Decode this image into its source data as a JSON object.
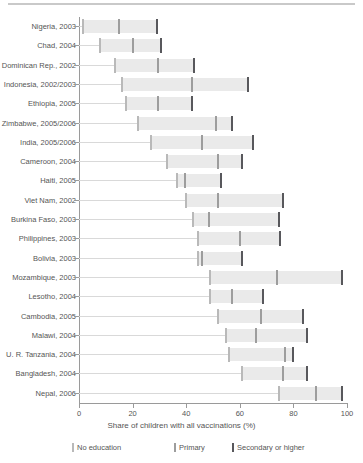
{
  "chart_data": {
    "type": "bar",
    "title": "",
    "xlabel": "Share of children with all vaccinations (%)",
    "ylabel": "",
    "xlim": [
      0,
      100
    ],
    "xticks": [
      0,
      20,
      40,
      60,
      80,
      100
    ],
    "xtick_labels": [
      "0",
      "20",
      "40",
      "60",
      "80",
      "100"
    ],
    "grid": false,
    "legend_position": "bottom",
    "series": [
      {
        "name": "No education",
        "key": "no_education",
        "color": "#b9b9b9"
      },
      {
        "name": "Primary",
        "key": "primary",
        "color": "#9d9d9d"
      },
      {
        "name": "Secondary or higher",
        "key": "secondary",
        "color": "#58585c"
      }
    ],
    "categories": [
      "Nigeria, 2003",
      "Chad, 2004",
      "Dominican Rep., 2002",
      "Indonesia, 2002/2003",
      "Ethiopia, 2005",
      "Zimbabwe, 2005/2006",
      "India, 2005/2006",
      "Cameroon, 2004",
      "Haiti, 2005",
      "Viet Nam, 2002",
      "Burkina Faso, 2003",
      "Philippines, 2003",
      "Bolivia, 2003",
      "Mozambique, 2003",
      "Lesotho, 2004",
      "Cambodia, 2005",
      "Malawi, 2004",
      "U. R. Tanzania, 2004",
      "Bangladesh, 2004",
      "Nepal, 2006"
    ],
    "rows": [
      {
        "label": "Nigeria, 2003",
        "no_education": 1.5,
        "primary": 15.0,
        "secondary": 29.0
      },
      {
        "label": "Chad, 2004",
        "no_education": 8.0,
        "primary": 20.0,
        "secondary": 30.5
      },
      {
        "label": "Dominican Rep., 2002",
        "no_education": 13.5,
        "primary": 29.5,
        "secondary": 43.0
      },
      {
        "label": "Indonesia, 2002/2003",
        "no_education": 16.0,
        "primary": 42.0,
        "secondary": 63.0
      },
      {
        "label": "Ethiopia, 2005",
        "no_education": 17.5,
        "primary": 29.5,
        "secondary": 42.0
      },
      {
        "label": "Zimbabwe, 2005/2006",
        "no_education": 22.0,
        "primary": 51.0,
        "secondary": 57.0
      },
      {
        "label": "India, 2005/2006",
        "no_education": 27.0,
        "primary": 46.0,
        "secondary": 65.0
      },
      {
        "label": "Cameroon, 2004",
        "no_education": 33.0,
        "primary": 52.0,
        "secondary": 61.0
      },
      {
        "label": "Haiti, 2005",
        "no_education": 36.5,
        "primary": 39.5,
        "secondary": 53.0
      },
      {
        "label": "Viet Nam, 2002",
        "no_education": 40.0,
        "primary": 52.0,
        "secondary": 76.0
      },
      {
        "label": "Burkina Faso, 2003",
        "no_education": 42.5,
        "primary": 48.5,
        "secondary": 74.5
      },
      {
        "label": "Philippines, 2003",
        "no_education": 44.5,
        "primary": 60.0,
        "secondary": 75.0
      },
      {
        "label": "Bolivia, 2003",
        "no_education": 44.5,
        "primary": 46.0,
        "secondary": 61.0
      },
      {
        "label": "Mozambique, 2003",
        "no_education": 49.0,
        "primary": 74.0,
        "secondary": 98.0
      },
      {
        "label": "Lesotho, 2004",
        "no_education": 49.0,
        "primary": 57.0,
        "secondary": 68.5
      },
      {
        "label": "Cambodia, 2005",
        "no_education": 52.0,
        "primary": 68.0,
        "secondary": 83.5
      },
      {
        "label": "Malawi, 2004",
        "no_education": 55.0,
        "primary": 66.0,
        "secondary": 85.0
      },
      {
        "label": "U. R. Tanzania, 2004",
        "no_education": 56.0,
        "primary": 77.0,
        "secondary": 80.0
      },
      {
        "label": "Bangladesh, 2004",
        "no_education": 61.0,
        "primary": 76.0,
        "secondary": 85.0
      },
      {
        "label": "Nepal, 2006",
        "no_education": 74.5,
        "primary": 88.5,
        "secondary": 98.0
      }
    ]
  },
  "axis": {
    "x_title": "Share of children with all vaccinations (%)"
  },
  "legend": {
    "items": [
      {
        "label": "No education",
        "color": "#b9b9b9"
      },
      {
        "label": "Primary",
        "color": "#9d9d9d"
      },
      {
        "label": "Secondary or higher",
        "color": "#58585c"
      }
    ]
  },
  "colors": {
    "band": "#eaeaea",
    "axis": "#9a9a9a",
    "leader": "#d9d9d9",
    "text": "#555555",
    "rule": "#c9c9c9"
  }
}
